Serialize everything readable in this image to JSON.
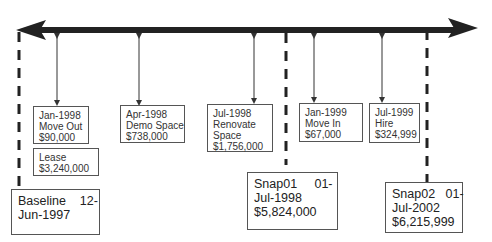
{
  "diagram": {
    "type": "timeline",
    "events": [
      {
        "date": "Jan-1998",
        "label": "Move Out",
        "amount": "$90,000"
      },
      {
        "date": "",
        "label": "Lease",
        "amount": "$3,240,000"
      },
      {
        "date": "Apr-1998",
        "label": "Demo Space",
        "amount": "$738,000"
      },
      {
        "date": "Jul-1998",
        "label": "Renovate",
        "label2": "Space",
        "amount": "$1,756,000"
      },
      {
        "date": "Jan-1999",
        "label": "Move In",
        "amount": "$67,000"
      },
      {
        "date": "Jul-1999",
        "label": "Hire",
        "amount": "$324,999"
      }
    ],
    "snapshots": [
      {
        "line1": "Baseline    12-",
        "line2": "Jun-1997"
      },
      {
        "line1": "Snap01     01-",
        "line2": "Jul-1998",
        "line3": "$5,824,000"
      },
      {
        "line1": "Snap02   01-",
        "line2": "Jul-2002",
        "line3": "$6,215,999"
      }
    ],
    "colors": {
      "axis": "#222222",
      "box_border": "#555555"
    }
  }
}
